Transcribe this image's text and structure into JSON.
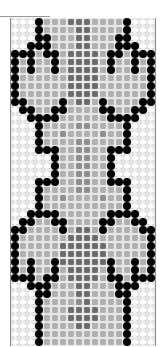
{
  "pattern": {
    "columns": 18,
    "rows": [
      "WWWBLLLDDDLLLLBWWW",
      "WWWBLLLLDDLLLLBWWW",
      "WWWBBLLLDDLLLBBWWW",
      "WWBBBLLLDDLLLBBBWW",
      "BBBLBBLDDDDLBBLBBB",
      "BLBLLBLDDDDLBLLBLB",
      "BLBLLBLDDDDLBLLBLB",
      "BLLLLLLDDDDLLLLLLB",
      "BLLLLLLDDDDLLLLLLB",
      "BLLLLLLDDDDLLLLLLB",
      "BBLLLLBLDDLBLLLLBB",
      "WBBLLBBLLLLBBLLBBW",
      "WWBBBBLLLLLLBBBBWW",
      "WWWBLLLLMMLLLLBWWW",
      "WWWBLLMLLLLMLLBWWW",
      "WWWBLLLLMMLLLLBWWW",
      "WWWBBBLLMMLLBBBWWW",
      "WWWWWBLLMMLLBWWWWW",
      "WWWWWBLLMMLLBWWWWW",
      "WWWWWBLLMMLLBWWWWW",
      "WWWBBBLLMMLLBBBWWW",
      "WWWBLLLLMMLLLLBWWW",
      "WWWBLLMLLLLMLLBWWW",
      "WWWBLLLLLLLLLLBWWW",
      "WWBBBBLLLLLLBBBBWW",
      "WBBLLBBLLLLBBLLBBW",
      "BBLLLLBLDDLBLLLLBB",
      "BLLLLLLDDDDLLLLLLB",
      "BLLLLLDDDDDDLLLLLB",
      "BLLLLLDDDDDDLLLLLB",
      "BLBLLBDDDDDDBLLBLB",
      "BLBLLBLDDDDLBLLBLB",
      "BBBLBBLDDDDLBBLBBB",
      "WWBBBLLLDDLLLBBBWW",
      "WWWBBLLLDDLLLBBWWW",
      "WWWBLLLLMDLLLLBWWW",
      "WWWBLLLDDDDLLLBWWW",
      "WWWBLLLDDDDLLLBWWW",
      "WWWBLLLLDDLLLLBWWW",
      "WWWBLLLLLLLLLLBWWW",
      "WWWBLLLLLLLLLLBWWW"
    ],
    "legend": {
      "W": "white bead",
      "B": "black bead",
      "L": "light gray bead",
      "M": "medium gray bead",
      "D": "dark gray bead"
    },
    "colors": {
      "W": "#ffffff",
      "B": "#000000",
      "L": "#b0b0b0",
      "M": "#8e8e8e",
      "D": "#6c6c6c"
    }
  }
}
